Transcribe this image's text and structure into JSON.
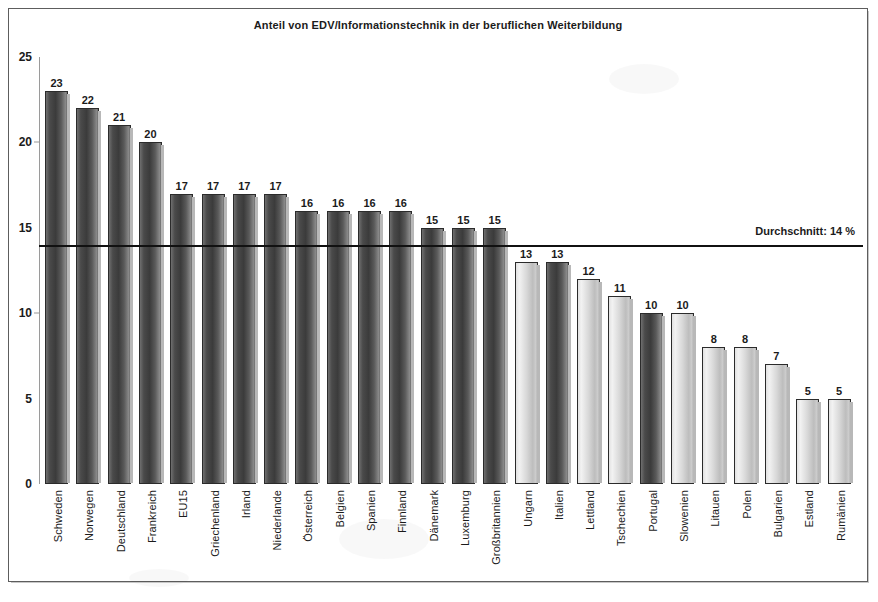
{
  "chart_data": {
    "type": "bar",
    "title": "Anteil von EDV/Informationstechnik in der beruflichen Weiterbildung",
    "xlabel": "",
    "ylabel": "",
    "ylim": [
      0,
      25
    ],
    "yticks": [
      0,
      5,
      10,
      15,
      20,
      25
    ],
    "grid": false,
    "legend": "none",
    "categories": [
      "Schweden",
      "Norwegen",
      "Deutschland",
      "Frankreich",
      "EU15",
      "Griechenland",
      "Irland",
      "Niederlande",
      "Österreich",
      "Belgien",
      "Spanien",
      "Finnland",
      "Dänemark",
      "Luxemburg",
      "Großbritannien",
      "Ungarn",
      "Italien",
      "Lettland",
      "Tschechien",
      "Portugal",
      "Slowenien",
      "Litauen",
      "Polen",
      "Bulgarien",
      "Estland",
      "Rumänien"
    ],
    "values": [
      23,
      22,
      21,
      20,
      17,
      17,
      17,
      17,
      16,
      16,
      16,
      16,
      15,
      15,
      15,
      13,
      13,
      12,
      11,
      10,
      10,
      8,
      8,
      7,
      5,
      5
    ],
    "bar_shades": [
      "dark",
      "dark",
      "dark",
      "dark",
      "dark",
      "dark",
      "dark",
      "dark",
      "dark",
      "dark",
      "dark",
      "dark",
      "dark",
      "dark",
      "dark",
      "light",
      "dark",
      "light",
      "light",
      "dark",
      "light",
      "light",
      "light",
      "light",
      "light",
      "light"
    ],
    "annotations": [
      {
        "name": "average-line",
        "label": "Durchschnitt: 14 %",
        "value": 14
      }
    ]
  },
  "colors": {
    "bar_dark": "#4a4a4a",
    "bar_light": "#d8d8d8",
    "axis": "#9a9a9a",
    "average_line": "#111111",
    "frame": "#5d5d5d",
    "text": "#1b1b1b"
  }
}
